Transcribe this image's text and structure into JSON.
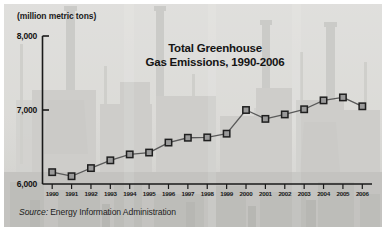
{
  "figure": {
    "unit_label": "(million metric tons)",
    "title_line1": "Total Greenhouse",
    "title_line2": "Gas Emissions, 1990-2006",
    "source_prefix": "Source:",
    "source_text": "Energy Information Administration",
    "background_description": "industrial-refinery-photo",
    "colors": {
      "axis": "#1a1a1a",
      "line": "#555555",
      "marker_fill": "#9a9a9a",
      "marker_edge": "#1f1f1f",
      "text": "#141414",
      "photo_base": "#c4c3bf"
    }
  },
  "chart_data": {
    "type": "line",
    "title": "Total Greenhouse Gas Emissions, 1990-2006",
    "subtitle": "",
    "xlabel": "",
    "ylabel": "(million metric tons)",
    "ylim": [
      6000,
      8000
    ],
    "yticks": [
      6000,
      7000,
      8000
    ],
    "ytick_labels": [
      "6,000",
      "7,000",
      "8,000"
    ],
    "grid": false,
    "legend": "none",
    "marker": "square",
    "categories": [
      "1990",
      "1991",
      "1992",
      "1993",
      "1994",
      "1995",
      "1996",
      "1997",
      "1998",
      "1999",
      "2000",
      "2001",
      "2002",
      "2003",
      "2004",
      "2005",
      "2006"
    ],
    "values": [
      6160,
      6105,
      6215,
      6320,
      6400,
      6425,
      6560,
      6625,
      6630,
      6680,
      7000,
      6880,
      6940,
      7010,
      7130,
      7170,
      7050
    ],
    "annotations": [],
    "source": "Source: Energy Information Administration"
  }
}
